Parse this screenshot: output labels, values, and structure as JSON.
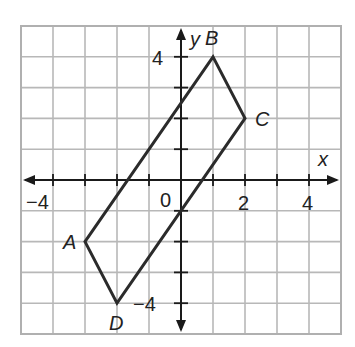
{
  "figure": {
    "type": "coordinate-grid",
    "x_axis_label": "x",
    "y_axis_label": "y",
    "range": {
      "x": [
        -5,
        5
      ],
      "y": [
        -5,
        5
      ]
    },
    "grid": true,
    "origin_label": "0",
    "x_tick_labels": [
      {
        "value": -4,
        "text": "−4"
      },
      {
        "value": 2,
        "text": "2"
      },
      {
        "value": 4,
        "text": "4"
      }
    ],
    "y_tick_labels": [
      {
        "value": 4,
        "text": "4"
      },
      {
        "value": -4,
        "text": "−4"
      }
    ],
    "colors": {
      "grid": "#b8b8b8",
      "axis": "#1a1a1a",
      "shape": "#2b2b2b"
    }
  },
  "quadrilateral": {
    "name": "ABCD",
    "vertices": [
      {
        "label": "A",
        "x": -3,
        "y": -2
      },
      {
        "label": "B",
        "x": 1,
        "y": 4
      },
      {
        "label": "C",
        "x": 2,
        "y": 2
      },
      {
        "label": "D",
        "x": -2,
        "y": -4
      }
    ]
  }
}
